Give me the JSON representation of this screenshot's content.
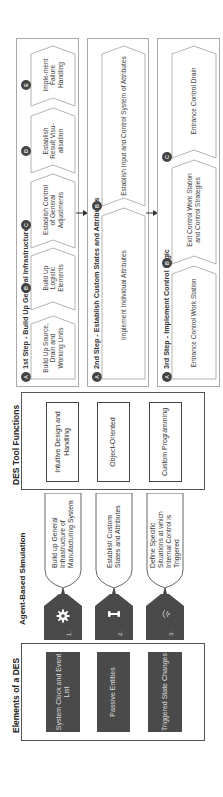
{
  "elements": {
    "title": "Elements of a DES",
    "items": [
      {
        "label": "System Clock and Event List"
      },
      {
        "label": "Passive Entities"
      },
      {
        "label": "Triggered State Changes"
      }
    ]
  },
  "agent": {
    "title": "Agent-Based Simulation",
    "items": [
      {
        "number": "1.",
        "icon": "gear-icon",
        "label": "Build up General Infrastructure of Manufacturing System"
      },
      {
        "number": "2.",
        "icon": "bone-icon",
        "label": "Establish Custom States and Attributes"
      },
      {
        "number": "3.",
        "icon": "signal-icon",
        "label": "Define Specific Situations at which Internal Control is Triggered"
      }
    ]
  },
  "tools": {
    "title": "DES Tool Functions",
    "items": [
      {
        "label": "Intuitive Design and Handling"
      },
      {
        "label": "Object-Oriented"
      },
      {
        "label": "Custom Programming"
      }
    ]
  },
  "steps": [
    {
      "title": "1st Step - Build Up General Infrastructure",
      "items": [
        {
          "badge": "A",
          "label": "Build Up Source, Drain and Working Units"
        },
        {
          "badge": "B",
          "label": "Build Up Logistic Elements"
        },
        {
          "badge": "C",
          "label": "Establish Control of General Adjustments"
        },
        {
          "badge": "D",
          "label": "Establish Result Visu-alisation"
        },
        {
          "badge": "E",
          "label": "Imple-ment Failure Handling"
        }
      ]
    },
    {
      "title": "2nd Step - Establish Custom States and Attributes",
      "items": [
        {
          "badge": "A",
          "label": "Implement Individual Attributes"
        },
        {
          "badge": "B",
          "label": "Establish Input and Control System of Attributes"
        }
      ]
    },
    {
      "title": "3rd Step - Implement Control Logic",
      "items": [
        {
          "badge": "A",
          "label": "Entrance Control Work Station"
        },
        {
          "badge": "B",
          "label": "Exit Control Work Station and Control Strategies"
        },
        {
          "badge": "C",
          "label": "Entrance Control Drain"
        }
      ]
    }
  ],
  "colors": {
    "dark_fill": "#4a4a4a",
    "border": "#444444",
    "panel_border": "#aaaaaa"
  }
}
